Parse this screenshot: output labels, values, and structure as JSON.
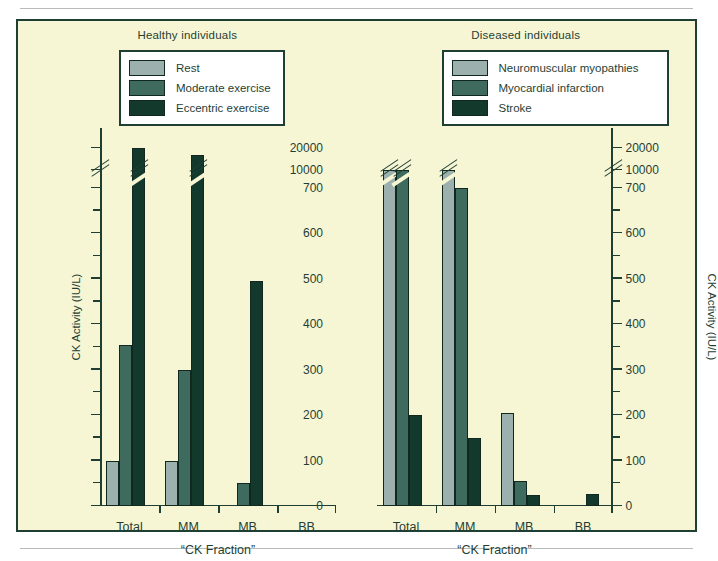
{
  "figure": {
    "background_color": "#f7f6d4",
    "border_color": "#1f3f35"
  },
  "panels": [
    {
      "id": "healthy",
      "title": "Healthy individuals",
      "legend": [
        {
          "label": "Rest",
          "color": "#9cb1ad"
        },
        {
          "label": "Moderate exercise",
          "color": "#3f6b5f"
        },
        {
          "label": "Eccentric exercise",
          "color": "#12392c"
        }
      ],
      "xaxis_title": "“CK Fraction”",
      "yaxis_title": "CK Activity (IU/L)"
    },
    {
      "id": "diseased",
      "title": "Diseased individuals",
      "legend": [
        {
          "label": "Neuromuscular myopathies",
          "color": "#9cb1ad"
        },
        {
          "label": "Myocardial infarction",
          "color": "#3f6b5f"
        },
        {
          "label": "Stroke",
          "color": "#12392c"
        }
      ],
      "xaxis_title": "“CK Fraction”",
      "yaxis_title": "CK Activity (IU/L)"
    }
  ],
  "axis": {
    "major_ticks": [
      0,
      100,
      200,
      300,
      400,
      500,
      600,
      700,
      10000,
      20000
    ],
    "minor_ticks": [
      50,
      150,
      250,
      350,
      450,
      550,
      650
    ],
    "break_between": [
      700,
      10000
    ],
    "tick_labels": [
      "0",
      "100",
      "200",
      "300",
      "400",
      "500",
      "600",
      "700",
      "10000",
      "20000"
    ]
  },
  "chart_data": [
    {
      "type": "bar",
      "title": "Healthy individuals",
      "xlabel": "“CK Fraction”",
      "ylabel": "CK Activity (IU/L)",
      "categories": [
        "Total",
        "MM",
        "MB",
        "BB"
      ],
      "series": [
        {
          "name": "Rest",
          "color": "#9cb1ad",
          "values": [
            100,
            100,
            0,
            0
          ]
        },
        {
          "name": "Moderate exercise",
          "color": "#3f6b5f",
          "values": [
            355,
            300,
            50,
            0
          ]
        },
        {
          "name": "Eccentric exercise",
          "color": "#12392c",
          "values": [
            20000,
            17000,
            495,
            0
          ]
        }
      ],
      "ylim": [
        0,
        20000
      ],
      "y_axis_broken": true,
      "y_break_range": [
        700,
        10000
      ],
      "grid": false,
      "legend_position": "top-center"
    },
    {
      "type": "bar",
      "title": "Diseased individuals",
      "xlabel": "“CK Fraction”",
      "ylabel": "CK Activity (IU/L)",
      "categories": [
        "Total",
        "MM",
        "MB",
        "BB"
      ],
      "series": [
        {
          "name": "Neuromuscular myopathies",
          "color": "#9cb1ad",
          "values": [
            9500,
            760,
            205,
            0
          ]
        },
        {
          "name": "Myocardial infarction",
          "color": "#3f6b5f",
          "values": [
            8800,
            700,
            55,
            0
          ]
        },
        {
          "name": "Stroke",
          "color": "#12392c",
          "values": [
            200,
            150,
            25,
            27
          ]
        }
      ],
      "ylim": [
        0,
        20000
      ],
      "y_axis_broken": true,
      "y_break_range": [
        700,
        10000
      ],
      "grid": false,
      "legend_position": "top-center"
    }
  ]
}
